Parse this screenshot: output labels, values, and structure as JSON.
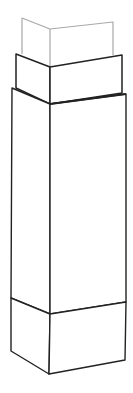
{
  "diagram": {
    "title": "",
    "colors": {
      "background": "#ffffff",
      "top_box_stroke": "#a8a8a8",
      "stroke": "#222222"
    },
    "parts": [
      {
        "name": "top-box",
        "style": "light",
        "left": [
          22,
          18
        ],
        "mid_top": [
          50,
          29
        ],
        "right": [
          113,
          22
        ],
        "bottom_left": [
          22,
          54
        ],
        "bottom_mid": [
          50,
          67
        ],
        "bottom_right": [
          113,
          55
        ]
      },
      {
        "name": "collar-box",
        "style": "dark",
        "left": [
          16,
          54
        ],
        "mid_top": [
          50,
          67
        ],
        "right": [
          122,
          55
        ],
        "bottom_left": [
          16,
          82
        ],
        "bottom_mid": [
          50,
          104
        ],
        "bottom_right": [
          122,
          93
        ]
      },
      {
        "name": "main-shaft",
        "style": "dark",
        "left": [
          12,
          88
        ],
        "mid_top": [
          50,
          104
        ],
        "right": [
          126,
          94
        ],
        "bottom_left": [
          11,
          298
        ],
        "bottom_mid": [
          50,
          314
        ],
        "bottom_right": [
          126,
          302
        ]
      },
      {
        "name": "base-block",
        "style": "dark",
        "left": [
          11,
          298
        ],
        "mid_top": [
          50,
          314
        ],
        "right": [
          126,
          302
        ],
        "bottom_left": [
          11,
          351
        ],
        "bottom_mid": [
          49,
          374
        ],
        "bottom_right": [
          125,
          360
        ]
      }
    ]
  }
}
